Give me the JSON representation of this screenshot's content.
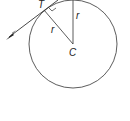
{
  "diagram": {
    "labels": {
      "tangent_point": "T",
      "center": "C",
      "radius_slanted": "r",
      "radius_vertical": "r"
    },
    "colors": {
      "stroke": "#333333",
      "background": "#ffffff"
    }
  }
}
